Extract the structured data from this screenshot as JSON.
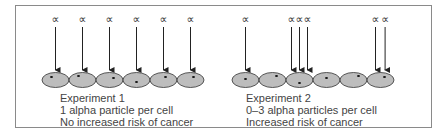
{
  "diagram": {
    "alpha_symbol": "∝",
    "colors": {
      "cell_fill": "#bdbdbd",
      "cell_stroke": "#333333",
      "arrow": "#222222",
      "border": "#8a8a8a",
      "text": "#444444"
    },
    "experiment1": {
      "title": "Experiment 1",
      "line2": "1 alpha particle per cell",
      "line3": "No increased risk of cancer",
      "arrows_per_cell": [
        1,
        1,
        1,
        1,
        1,
        1
      ]
    },
    "experiment2": {
      "title": "Experiment 2",
      "line2": "0–3 alpha particles per cell",
      "line3": "Increased risk of cancer",
      "arrows_per_cell": [
        1,
        0,
        3,
        0,
        0,
        2
      ]
    }
  }
}
